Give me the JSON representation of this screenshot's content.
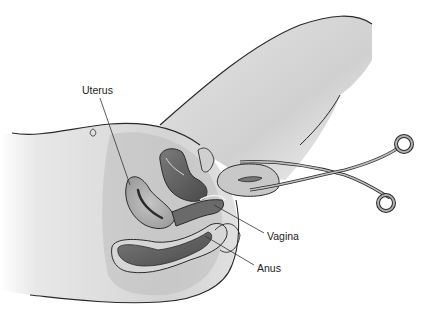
{
  "diagram": {
    "type": "anatomical-illustration",
    "labels": [
      {
        "id": "uterus",
        "text": "Uterus",
        "x": 82,
        "y": 85
      },
      {
        "id": "vagina",
        "text": "Vagina",
        "x": 267,
        "y": 231
      },
      {
        "id": "anus",
        "text": "Anus",
        "x": 257,
        "y": 263
      }
    ],
    "instrument": {
      "name": "forceps"
    },
    "colors": {
      "outline": "#2a2a2a",
      "skin_light": "#e6e6e6",
      "skin_mid": "#cfcfcf",
      "tissue_mid": "#9a9a9a",
      "tissue_dark": "#5a5a5a",
      "leader_line": "#333333"
    }
  }
}
